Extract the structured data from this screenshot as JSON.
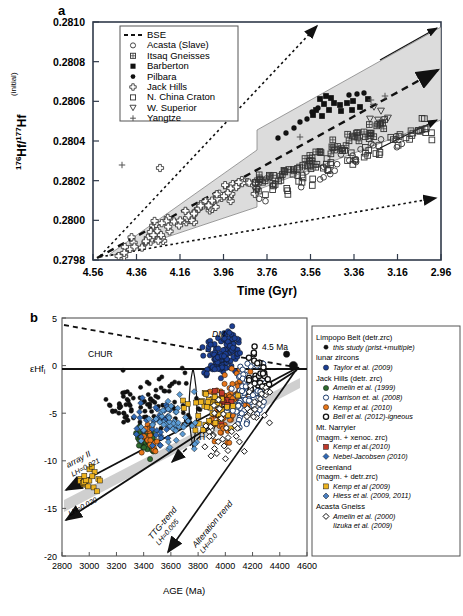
{
  "figure": {
    "panel_a_letter": "a",
    "panel_b_letter": "b"
  },
  "panel_a": {
    "xlabel": "Time (Gyr)",
    "ylabel_main": "Hf/",
    "ylabel_sup1": "176",
    "ylabel_sup2": "177",
    "ylabel_hf2": "Hf",
    "ylabel_sub": "(initial)",
    "xticks": [
      "4.56",
      "4.36",
      "4.16",
      "3.96",
      "3.76",
      "3.56",
      "3.36",
      "3.16",
      "2.96"
    ],
    "yticks": [
      "0.2810",
      "0.2808",
      "0.2806",
      "0.2804",
      "0.2802",
      "0.2800",
      "0.2798"
    ],
    "legend": [
      {
        "symbol": "dashed-line",
        "label": "BSE"
      },
      {
        "symbol": "open-circle",
        "label": "Acasta (Slave)"
      },
      {
        "symbol": "gridded-square",
        "label": "Itsaq Gneisses"
      },
      {
        "symbol": "filled-square",
        "label": "Barberton"
      },
      {
        "symbol": "filled-circle",
        "label": "Pilbara"
      },
      {
        "symbol": "cross-cluster",
        "label": "Jack Hills"
      },
      {
        "symbol": "open-square",
        "label": "N. China Craton"
      },
      {
        "symbol": "open-down-triangle",
        "label": "W. Superior"
      },
      {
        "symbol": "plus",
        "label": "Yangtze"
      }
    ]
  },
  "panel_b": {
    "xlabel": "AGE (Ma)",
    "ylabel": "εHf",
    "ylabel_sub": "i",
    "xticks": [
      "2800",
      "3000",
      "3200",
      "3400",
      "3600",
      "3800",
      "4000",
      "4200",
      "4400",
      "4600"
    ],
    "yticks": [
      "5",
      "0",
      "-5",
      "-10",
      "-15",
      "-20"
    ],
    "annotations": {
      "chur": "CHUR",
      "dm": "DM",
      "age_marker": "4.5 Ma",
      "array2_name": "array II",
      "array2_lh": "LH=0.021",
      "lh020": "LH=0.020",
      "ttg_name": "TTG-trend",
      "ttg_lh": "LH=0.005",
      "alteration_name": "Alteration trend",
      "alteration_lh": "LH=0.0",
      "h_label": "H"
    },
    "legend_groups": [
      {
        "header": "Limpopo Belt (detr.zrc)",
        "entries": [
          {
            "symbol": "small-black-dot",
            "color": "#111111",
            "label": "this study (prist.+multiple)"
          }
        ]
      },
      {
        "header": "lunar zircons",
        "entries": [
          {
            "symbol": "filled-circle",
            "color": "#1c3f94",
            "label": "Taylor et al. (2009)"
          }
        ]
      },
      {
        "header": "Jack Hills (detr. zrc)",
        "entries": [
          {
            "symbol": "filled-circle",
            "color": "#2e6b2e",
            "label": "Amelin et al. (1999)"
          },
          {
            "symbol": "open-circle",
            "color": "#111111",
            "label": "Harrison et. al. (2008)"
          },
          {
            "symbol": "filled-circle",
            "color": "#e8761a",
            "label": "Kemp et al. (2010)"
          },
          {
            "symbol": "open-circle-bold",
            "color": "#111111",
            "label": "Bell et al. (2012)-igneous"
          }
        ]
      },
      {
        "header": "Mt. Narryier",
        "header2": "(magm. + xenoc. zrc)",
        "entries": [
          {
            "symbol": "filled-square",
            "color": "#c0392b",
            "label": "Kemp et al.(2010)"
          },
          {
            "symbol": "diamond",
            "color": "#2f68b5",
            "label": "Nebel-Jacobsen (2010)"
          }
        ]
      },
      {
        "header": "Greenland",
        "header2": "(magm. + detr.zrc)",
        "entries": [
          {
            "symbol": "filled-square",
            "color": "#edb320",
            "label": "Kemp et al (2009)"
          },
          {
            "symbol": "diamond",
            "color": "#4a7fc1",
            "label": "Hiess et al. (2009, 2011)"
          }
        ]
      },
      {
        "header": "Acasta Gneiss",
        "entries": [
          {
            "symbol": "open-diamond",
            "color": "#111111",
            "label": "Amelin et al. (2000)"
          },
          {
            "symbol": "none",
            "color": "#111111",
            "label": "Iizuka et al. (2009)"
          }
        ]
      }
    ]
  },
  "colors": {
    "band_gray": "#d9d9d9",
    "axis": "#303a4a",
    "blue": "#2f4f9e",
    "orange": "#e8761a",
    "green": "#2e6b2e",
    "yellow": "#edb320",
    "black": "#111111",
    "lightblue": "#5b9bd5"
  }
}
